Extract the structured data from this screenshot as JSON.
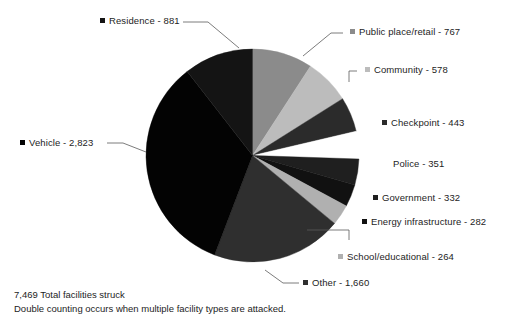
{
  "chart_data": {
    "type": "pie",
    "title": "",
    "subtitle": "",
    "xlabel": "",
    "ylabel": "",
    "legend_position": "outside-callouts",
    "grid": false,
    "total": 7469,
    "total_label": "7,469 Total facilities struck",
    "note": "Double counting occurs when multiple facility types are attacked.",
    "categories": [
      "Public place/retail",
      "Community",
      "Checkpoint",
      "Police",
      "Government",
      "Energy infrastructure",
      "School/educational",
      "Other",
      "Vehicle",
      "Residence"
    ],
    "values": [
      767,
      578,
      443,
      351,
      332,
      282,
      264,
      1660,
      2823,
      881
    ],
    "slices": [
      {
        "label": "Public place/retail - 767",
        "name": "Public place/retail",
        "value": 767,
        "value_text": "767",
        "color": "#8b8b8b",
        "has_marker": true
      },
      {
        "label": "Community - 578",
        "name": "Community",
        "value": 578,
        "value_text": "578",
        "color": "#bcbcbc",
        "has_marker": true
      },
      {
        "label": "Checkpoint - 443",
        "name": "Checkpoint",
        "value": 443,
        "value_text": "443",
        "color": "#2b2b2b",
        "has_marker": true
      },
      {
        "label": "Police - 351",
        "name": "Police",
        "value": 351,
        "value_text": "351",
        "color": "#ffffff",
        "has_marker": false
      },
      {
        "label": "Government - 332",
        "name": "Government",
        "value": 332,
        "value_text": "332",
        "color": "#1f1f1f",
        "has_marker": true
      },
      {
        "label": "Energy infrastructure - 282",
        "name": "Energy infrastructure",
        "value": 282,
        "value_text": "282",
        "color": "#111111",
        "has_marker": true
      },
      {
        "label": "School/educational - 264",
        "name": "School/educational",
        "value": 264,
        "value_text": "264",
        "color": "#b0b0b0",
        "has_marker": true
      },
      {
        "label": "Other - 1,660",
        "name": "Other",
        "value": 1660,
        "value_text": "1,660",
        "color": "#2f2f2f",
        "has_marker": true
      },
      {
        "label": "Vehicle - 2,823",
        "name": "Vehicle",
        "value": 2823,
        "value_text": "2,823",
        "color": "#030303",
        "has_marker": true
      },
      {
        "label": "Residence - 881",
        "name": "Residence",
        "value": 881,
        "value_text": "881",
        "color": "#141414",
        "has_marker": true
      }
    ]
  },
  "footer": {
    "total_line": "7,469 Total facilities struck",
    "note_line": "Double counting occurs when multiple facility types are attacked."
  },
  "labels": {
    "residence": "Residence - 881",
    "public_place": "Public place/retail - 767",
    "community": "Community - 578",
    "checkpoint": "Checkpoint - 443",
    "police": "Police - 351",
    "government": "Government - 332",
    "energy": "Energy infrastructure - 282",
    "school": "School/educational - 264",
    "other": "Other - 1,660",
    "vehicle": "Vehicle - 2,823"
  },
  "colors": {
    "background": "#ffffff",
    "text": "#1d1d1d",
    "leader_line": "#5a5a5a"
  }
}
